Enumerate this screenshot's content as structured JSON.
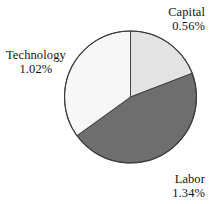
{
  "chart_data": {
    "type": "pie",
    "title": "",
    "subtitle": "",
    "xlabel": "",
    "ylabel": "",
    "grid": false,
    "legend_position": "none",
    "label_format": "percent",
    "categories": [
      "Capital",
      "Labor",
      "Technology"
    ],
    "values": [
      0.56,
      1.34,
      1.02
    ],
    "value_labels": [
      "0.56%",
      "1.34%",
      "1.02%"
    ],
    "slice_colors": [
      "#e3e3e3",
      "#6e6e6e",
      "#f7f7f7"
    ],
    "slice_outline_color": "#3a3a3a",
    "start_angle_deg": 0,
    "direction": "clockwise",
    "slice_angles_deg": [
      69.0,
      165.2,
      125.8
    ],
    "slices": [
      {
        "name": "Capital",
        "value": 0.56,
        "value_label": "0.56%",
        "color": "#e3e3e3",
        "start_deg": 0.0,
        "end_deg": 69.0
      },
      {
        "name": "Labor",
        "value": 1.34,
        "value_label": "1.34%",
        "color": "#6e6e6e",
        "start_deg": 69.0,
        "end_deg": 234.2
      },
      {
        "name": "Technology",
        "value": 1.02,
        "value_label": "1.02%",
        "color": "#f7f7f7",
        "start_deg": 234.2,
        "end_deg": 360.0
      }
    ]
  },
  "labels": {
    "capital": {
      "name": "Capital",
      "value": "0.56%"
    },
    "labor": {
      "name": "Labor",
      "value": "1.34%"
    },
    "technology": {
      "name": "Technology",
      "value": "1.02%"
    }
  }
}
